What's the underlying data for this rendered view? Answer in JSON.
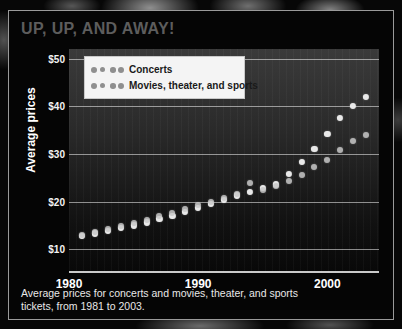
{
  "title": "UP, UP, AND AWAY!",
  "caption_line1": "Average prices for concerts and movies, theater, and sports",
  "caption_line2": "tickets, from 1981 to 2003.",
  "colors": {
    "frame_border": "#9a9a9a",
    "title_text": "#5d5d5d",
    "axis_text": "#ffffff",
    "gridline": "rgba(255,255,255,0.52)",
    "concerts_marker": "#efefef",
    "movies_marker": "#c9c9c9",
    "legend_background": "#f4f4f4",
    "legend_text": "#1a1a1a",
    "caption_text": "#e8e8e8"
  },
  "legend": {
    "position": "top-left-inside-plot",
    "entries": [
      {
        "label": "Concerts",
        "marker": "dotted-circles",
        "color": "#efefef"
      },
      {
        "label": "Movies, theater, and sports",
        "marker": "dotted-circles",
        "color": "#c9c9c9"
      }
    ]
  },
  "chart_data": {
    "type": "scatter",
    "title": "UP, UP, AND AWAY!",
    "subtitle": "",
    "xlabel": "",
    "ylabel": "Average prices",
    "xlim": [
      1980,
      2004
    ],
    "ylim": [
      5,
      52
    ],
    "grid": true,
    "x_ticks": [
      "1980",
      "1990",
      "2000"
    ],
    "x_tick_values": [
      1980,
      1990,
      2000
    ],
    "y_ticks": [
      "$10",
      "$20",
      "$30",
      "$40",
      "$50"
    ],
    "y_tick_values": [
      10,
      20,
      30,
      40,
      50
    ],
    "x": [
      1981,
      1982,
      1983,
      1984,
      1985,
      1986,
      1987,
      1988,
      1989,
      1990,
      1991,
      1992,
      1993,
      1994,
      1995,
      1996,
      1997,
      1998,
      1999,
      2000,
      2001,
      2002,
      2003
    ],
    "series": [
      {
        "name": "Concerts",
        "color": "#efefef",
        "values": [
          12.8,
          13.3,
          13.9,
          14.4,
          15.0,
          15.6,
          16.3,
          17.0,
          17.8,
          18.6,
          19.5,
          20.4,
          21.3,
          22.1,
          22.8,
          23.6,
          25.8,
          28.3,
          31.0,
          34.2,
          37.6,
          40.0,
          42.0
        ]
      },
      {
        "name": "Movies, theater, and sports",
        "color": "#c9c9c9",
        "values": [
          13.0,
          13.6,
          14.2,
          14.9,
          15.5,
          16.2,
          16.9,
          17.6,
          18.4,
          19.2,
          20.0,
          20.7,
          21.5,
          23.8,
          22.4,
          23.2,
          24.3,
          25.6,
          27.2,
          28.8,
          30.8,
          32.6,
          34.0
        ]
      }
    ]
  }
}
